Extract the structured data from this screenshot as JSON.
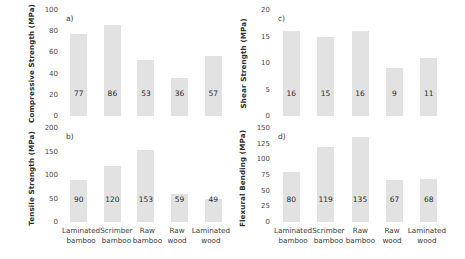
{
  "figure": {
    "categories": [
      "Laminated bamboo",
      "Scrimber bamboo",
      "Raw bamboo",
      "Raw wood",
      "Laminated wood"
    ],
    "category_lines": [
      [
        "Laminated",
        "bamboo"
      ],
      [
        "Scrimber",
        "bamboo"
      ],
      [
        "Raw",
        "bamboo"
      ],
      [
        "Raw",
        "wood"
      ],
      [
        "Laminated",
        "wood"
      ]
    ],
    "bar_color": "#e2e2e2",
    "text_color": "#3a3a3a"
  },
  "chart_data": [
    {
      "id": "a",
      "type": "bar",
      "panel_letter": "a)",
      "title": "",
      "ylabel": "Compressive Strength (MPa)",
      "xlabel": "",
      "categories": [
        "Laminated bamboo",
        "Scrimber bamboo",
        "Raw bamboo",
        "Raw wood",
        "Laminated wood"
      ],
      "values": [
        77,
        86,
        53,
        36,
        57
      ],
      "ylim": [
        0,
        100
      ],
      "yticks": [
        0,
        20,
        40,
        60,
        80,
        100
      ],
      "grid": false,
      "legend": "none"
    },
    {
      "id": "c",
      "type": "bar",
      "panel_letter": "c)",
      "title": "",
      "ylabel": "Shear Strength (MPa)",
      "xlabel": "",
      "categories": [
        "Laminated bamboo",
        "Scrimber bamboo",
        "Raw bamboo",
        "Raw wood",
        "Laminated wood"
      ],
      "values": [
        16,
        15,
        16,
        9,
        11
      ],
      "ylim": [
        0,
        20
      ],
      "yticks": [
        0,
        5,
        10,
        15,
        20
      ],
      "grid": false,
      "legend": "none"
    },
    {
      "id": "b",
      "type": "bar",
      "panel_letter": "b)",
      "title": "",
      "ylabel": "Tensile Strength (MPa)",
      "xlabel": "",
      "categories": [
        "Laminated bamboo",
        "Scrimber bamboo",
        "Raw bamboo",
        "Raw wood",
        "Laminated wood"
      ],
      "values": [
        90,
        120,
        153,
        59,
        49
      ],
      "ylim": [
        0,
        200
      ],
      "yticks": [
        0,
        50,
        100,
        150,
        200
      ],
      "grid": false,
      "legend": "none"
    },
    {
      "id": "d",
      "type": "bar",
      "panel_letter": "d)",
      "title": "",
      "ylabel": "Flexural Bending (MPa)",
      "xlabel": "",
      "categories": [
        "Laminated bamboo",
        "Scrimber bamboo",
        "Raw bamboo",
        "Raw wood",
        "Laminated wood"
      ],
      "values": [
        80,
        119,
        135,
        67,
        68
      ],
      "ylim": [
        0,
        150
      ],
      "yticks": [
        0,
        25,
        50,
        75,
        100,
        125,
        150
      ],
      "grid": false,
      "legend": "none"
    }
  ]
}
